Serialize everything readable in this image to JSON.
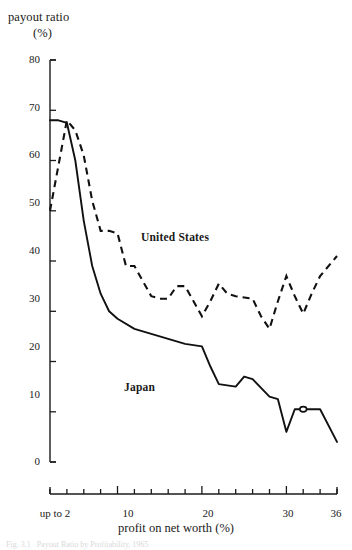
{
  "chart_data": {
    "type": "line",
    "title": "",
    "ylabel_line1": "payout ratio",
    "ylabel_line2": "(%)",
    "xlabel": "profit on net worth (%)",
    "xlim": [
      0,
      36
    ],
    "ylim": [
      0,
      80
    ],
    "grid": false,
    "legend_position": "inline-annotation",
    "y_ticks": [
      0,
      10,
      20,
      30,
      40,
      50,
      60,
      70,
      80
    ],
    "y_tick_labels": [
      "0",
      "10",
      "20",
      "30",
      "40",
      "50",
      "60",
      "70",
      "80"
    ],
    "x_ticks": [
      2,
      4,
      6,
      8,
      10,
      12,
      14,
      16,
      18,
      20,
      22,
      24,
      26,
      28,
      30,
      32,
      34,
      36
    ],
    "x_tick_labels_shown": [
      {
        "x": 2,
        "label": "up to 2"
      },
      {
        "x": 10,
        "label": "10"
      },
      {
        "x": 20,
        "label": "20"
      },
      {
        "x": 30,
        "label": "30"
      },
      {
        "x": 36,
        "label": "36"
      }
    ],
    "series": [
      {
        "name": "United States",
        "style": "dashed",
        "color": "#111111",
        "label_x": 16.0,
        "label_y": 41.5,
        "x": [
          2,
          4,
          6,
          8,
          10,
          12,
          14,
          16,
          18,
          20,
          22,
          24,
          26,
          28,
          30,
          32,
          34,
          36
        ],
        "values": [
          50,
          68,
          61,
          46,
          45.5,
          39,
          33,
          32.5,
          35,
          35,
          29,
          35.5,
          33.5,
          32.5,
          26.5,
          37,
          29.5,
          41
        ]
      },
      {
        "name": "Japan",
        "style": "solid",
        "color": "#111111",
        "label_x": 9.5,
        "label_y": 20.5,
        "marker_point": {
          "x": 32,
          "y": 10.5
        },
        "x": [
          2,
          4,
          6,
          8,
          10,
          12,
          14,
          16,
          18,
          20,
          22,
          24,
          26,
          28,
          30,
          32,
          34,
          36
        ],
        "values": [
          68,
          67,
          55,
          42,
          32,
          27,
          25.5,
          24.5,
          23,
          23,
          15.5,
          15,
          17,
          12,
          11,
          6,
          10.5,
          10.5
        ]
      }
    ],
    "japan_detail_x": [
      2,
      3,
      4,
      5,
      6,
      7,
      8,
      9,
      10,
      12,
      14,
      16,
      18,
      20,
      21,
      22,
      24,
      25,
      26,
      28,
      29,
      30,
      31,
      32,
      33,
      34,
      36
    ],
    "japan_detail_y": [
      68,
      68,
      67.5,
      60,
      48,
      39,
      33.5,
      30,
      28.5,
      26.5,
      25.5,
      24.5,
      23.5,
      23,
      19,
      15.5,
      15,
      17,
      16.5,
      13,
      12.5,
      6,
      10.5,
      10.5,
      10.5,
      10.5,
      4
    ],
    "us_detail_x": [
      2,
      4,
      5,
      6,
      7,
      8,
      9,
      10,
      11,
      12,
      14,
      15,
      16,
      17,
      18,
      20,
      21,
      22,
      23,
      24,
      26,
      27,
      28,
      29,
      30,
      31,
      32,
      33,
      34,
      36
    ],
    "us_detail_y": [
      50,
      68,
      66,
      61,
      52,
      46,
      46,
      45.5,
      39,
      39,
      33,
      32.5,
      32.5,
      35,
      35,
      29,
      32,
      35.5,
      33.5,
      33,
      32.5,
      29,
      26.5,
      32,
      37,
      33,
      29.5,
      33.5,
      37,
      41
    ]
  },
  "caption": "Fig. 3.1   Payout Ratio by Profitability, 1965",
  "axis": {
    "ytick_labels": [
      "80",
      "70",
      "60",
      "50",
      "40",
      "30",
      "20",
      "10",
      "0"
    ],
    "xtick_labels": [
      "up to 2",
      "10",
      "20",
      "30",
      "36"
    ]
  }
}
